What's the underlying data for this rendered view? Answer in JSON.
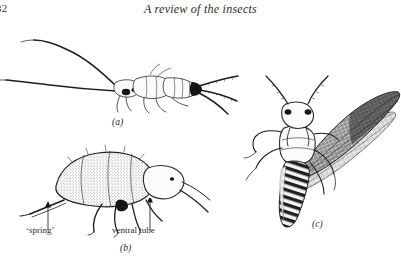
{
  "page": {
    "folio": "32",
    "running_head": "A review of the insects",
    "background_color": "#ffffff",
    "ink_color": "#1d1d1d"
  },
  "figures": [
    {
      "id": "a",
      "label": "(a)",
      "subject": "bristletail-silverfish-lateral-view",
      "description": "Apterygote insect in lateral view with two long antennae sweeping to the left and three caudal filaments fanning to the right",
      "annotations": []
    },
    {
      "id": "b",
      "label": "(b)",
      "subject": "springtail-collembola-lateral-view",
      "description": "Springtail in lateral view with stippled humped body, legs beneath and furcula extending to the lower left",
      "annotations": [
        {
          "id": "spring",
          "text": "‘spring’"
        },
        {
          "id": "ventral-tube",
          "text": "ventral tube"
        }
      ]
    },
    {
      "id": "c",
      "label": "(c)",
      "subject": "winged-insect-dorsal-view",
      "description": "Winged insect in dorsal view with paired antennae, banded abdomen and two stippled net-veined wings spread to the upper right",
      "annotations": []
    }
  ]
}
